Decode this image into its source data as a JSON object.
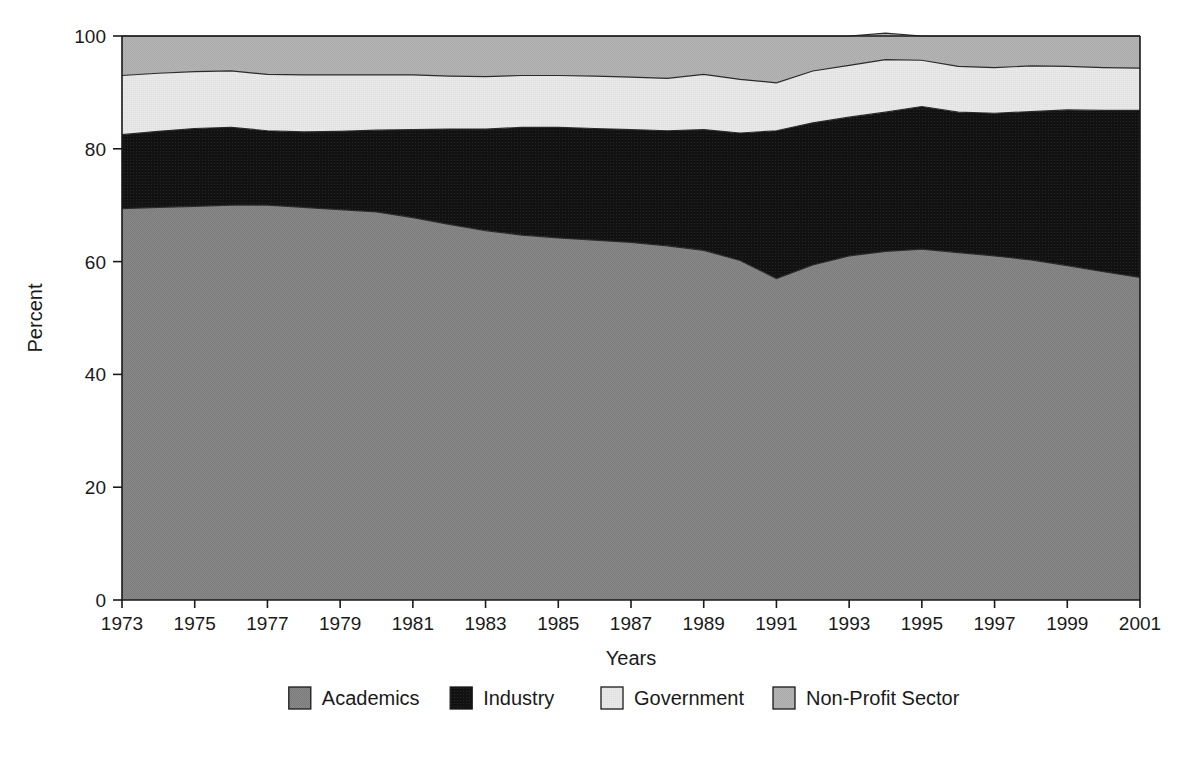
{
  "chart_data": {
    "type": "area",
    "stacked": true,
    "title": "",
    "xlabel": "Years",
    "ylabel": "Percent",
    "xlim": [
      1973,
      2001
    ],
    "ylim": [
      0,
      100
    ],
    "grid": false,
    "legend_position": "bottom",
    "x": [
      1973,
      1974,
      1975,
      1976,
      1977,
      1978,
      1979,
      1980,
      1981,
      1982,
      1983,
      1984,
      1985,
      1986,
      1987,
      1988,
      1989,
      1990,
      1991,
      1992,
      1993,
      1994,
      1995,
      1996,
      1997,
      1998,
      1999,
      2000,
      2001
    ],
    "xticks": [
      1973,
      1975,
      1977,
      1979,
      1981,
      1983,
      1985,
      1987,
      1989,
      1991,
      1993,
      1995,
      1997,
      1999,
      2001
    ],
    "xticklabels": [
      "1973",
      "1975",
      "1977",
      "1979",
      "1981",
      "1983",
      "1985",
      "1987",
      "1989",
      "1991",
      "1993",
      "1995",
      "1997",
      "1999",
      "2001"
    ],
    "yticks": [
      0,
      20,
      40,
      60,
      80,
      100
    ],
    "yticklabels": [
      "0",
      "20",
      "40",
      "60",
      "80",
      "100"
    ],
    "series": [
      {
        "name": "Academics",
        "color": "#878787",
        "values": [
          69.4,
          69.6,
          69.8,
          70.0,
          70.0,
          69.6,
          69.2,
          68.8,
          67.8,
          66.6,
          65.5,
          64.7,
          64.2,
          63.8,
          63.4,
          62.8,
          62.0,
          60.2,
          57.0,
          59.4,
          61.0,
          61.8,
          62.2,
          61.6,
          61.0,
          60.3,
          59.3,
          58.2,
          57.2
        ]
      },
      {
        "name": "Industry",
        "color": "#151515",
        "values": [
          13.1,
          13.5,
          13.8,
          13.8,
          13.2,
          13.4,
          13.9,
          14.5,
          15.6,
          16.9,
          18.0,
          19.1,
          19.6,
          19.8,
          20.0,
          20.4,
          21.4,
          22.6,
          26.2,
          25.2,
          24.6,
          24.7,
          25.3,
          24.9,
          25.3,
          26.3,
          27.6,
          28.6,
          29.6
        ]
      },
      {
        "name": "Government",
        "color": "#e6e6e6",
        "values": [
          10.5,
          10.3,
          10.1,
          10.0,
          10.0,
          10.1,
          10.0,
          9.8,
          9.7,
          9.4,
          9.3,
          9.2,
          9.2,
          9.3,
          9.3,
          9.3,
          9.8,
          9.5,
          8.5,
          9.2,
          9.2,
          9.3,
          8.2,
          8.1,
          8.1,
          8.1,
          7.7,
          7.6,
          7.5
        ]
      },
      {
        "name": "Non-Profit Sector",
        "color": "#b3b3b3",
        "values": [
          7.0,
          6.6,
          6.3,
          6.2,
          6.8,
          6.9,
          6.9,
          6.9,
          6.9,
          7.1,
          7.2,
          7.0,
          7.0,
          7.1,
          7.3,
          7.5,
          6.8,
          7.7,
          8.3,
          6.2,
          5.2,
          4.7,
          4.3,
          5.4,
          5.6,
          5.3,
          5.4,
          5.6,
          5.7
        ]
      }
    ]
  },
  "legend": {
    "items": [
      {
        "label": "Academics",
        "color": "#878787"
      },
      {
        "label": "Industry",
        "color": "#151515"
      },
      {
        "label": "Government",
        "color": "#e6e6e6"
      },
      {
        "label": "Non-Profit Sector",
        "color": "#b3b3b3"
      }
    ]
  },
  "axes": {
    "y_title": "Percent",
    "x_title": "Years"
  }
}
